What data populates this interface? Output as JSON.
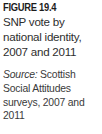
{
  "figure": {
    "number_label": "FIGURE 19.4",
    "title": "SNP vote by national identity, 2007 and 2011",
    "source_label": "Source:",
    "source_text": " Scottish Social Attitudes surveys, 2007 and 2011"
  },
  "colors": {
    "background": "#ffffff",
    "heading_text": "#1c1c1c",
    "title_text": "#2e2e2e",
    "source_text": "#3a3a3a"
  }
}
